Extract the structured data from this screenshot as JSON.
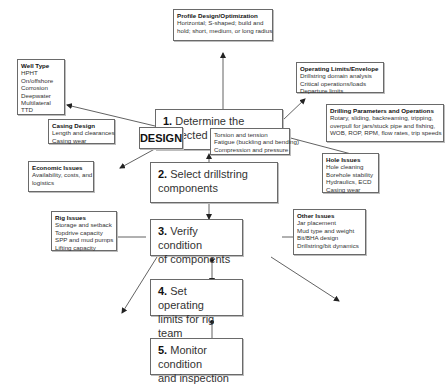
{
  "diagram": {
    "center_label": "DESIGN",
    "steps": [
      {
        "num": "1.",
        "line1": " Determine the",
        "line2": "expected loads"
      },
      {
        "num": "2.",
        "line1": " Select drillstring",
        "line2": "components"
      },
      {
        "num": "3.",
        "line1": " Verify condition",
        "line2": "of components"
      },
      {
        "num": "4.",
        "line1": " Set operating",
        "line2": "limits for rig team"
      },
      {
        "num": "5.",
        "line1": " Monitor condition",
        "line2": "and inspection"
      }
    ],
    "boxes": {
      "profile": {
        "title": "Profile Design/Optimization",
        "lines": [
          "Horizontal; S-shaped; build and",
          "hold; short, medium, or long radius"
        ]
      },
      "well_type": {
        "title": "Well Type",
        "lines": [
          "HPHT",
          "On/offshore",
          "Corrosion",
          "Deepwater",
          "Multilateral",
          "TTD"
        ]
      },
      "operating_limits": {
        "title": "Operating Limits/Envelope",
        "lines": [
          "Drillstring domain analysis",
          "Critical operations/loads",
          "Departure limits"
        ]
      },
      "drilling_params": {
        "title": "Drilling Parameters and  Operations",
        "lines": [
          "Rotary, sliding, backreaming, tripping,",
          "overpull for jars/stuck pipe and fishing,",
          "WOB, ROP, RPM, flow rates, trip speeds"
        ]
      },
      "casing_design": {
        "title": "Casing Design",
        "lines": [
          "Length and clearances",
          "Casing wear"
        ]
      },
      "loads": {
        "title": "",
        "lines": [
          "Torsion and tension",
          "Fatigue (buckling and bending)",
          "Compression and pressure"
        ]
      },
      "economic": {
        "title": "Economic Issues",
        "lines": [
          "Availability, costs, and",
          "logistics"
        ]
      },
      "hole": {
        "title": "Hole Issues",
        "lines": [
          "Hole cleaning",
          "Borehole stability",
          "Hydraulics, ECD",
          "Casing wear"
        ]
      },
      "rig": {
        "title": "Rig Issues",
        "lines": [
          "Storage and setback",
          "Topdrive capacity",
          "SPP and mud pumps",
          "Lifting capacity"
        ]
      },
      "other": {
        "title": "Other Issues",
        "lines": [
          "Jar placement",
          "Mud type and weight",
          "Bit/BHA design",
          "Drillstring/bit dynamics"
        ]
      }
    }
  },
  "colors": {
    "line": "#3a3a3a",
    "border": "#6a6a6a",
    "text": "#2a2a2a"
  }
}
